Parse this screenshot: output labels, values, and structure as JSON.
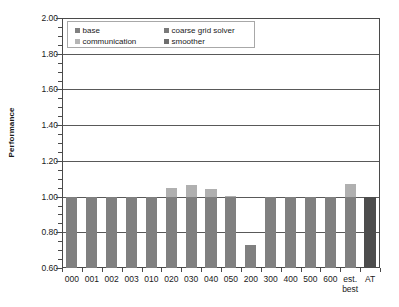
{
  "chart_data": {
    "type": "bar",
    "title": "",
    "subtitle": "",
    "xlabel": "",
    "ylabel": "Performance",
    "ylim": [
      0.6,
      2.0
    ],
    "ytick_labels": [
      "2.00",
      "1.80",
      "1.60",
      "1.40",
      "1.20",
      "1.00",
      "0.80",
      "0.60"
    ],
    "ytick_values": [
      2.0,
      1.8,
      1.6,
      1.4,
      1.2,
      1.0,
      0.8,
      0.6
    ],
    "ytick_step": 0.2,
    "yminor_step": 0.05,
    "grid": true,
    "grid_axis": "y",
    "legend_position": "top-left-inside",
    "stacked": true,
    "categories": [
      "000",
      "001",
      "002",
      "003",
      "010",
      "020",
      "030",
      "040",
      "050",
      "200",
      "300",
      "400",
      "500",
      "600",
      "est.\nbest",
      "AT"
    ],
    "category_labels_flat": [
      "000",
      "001",
      "002",
      "003",
      "010",
      "020",
      "030",
      "040",
      "050",
      "200",
      "300",
      "400",
      "500",
      "600",
      "est. best",
      "AT"
    ],
    "series": [
      {
        "name": "base",
        "color": "#808080",
        "values": [
          1.0,
          1.0,
          1.0,
          1.0,
          1.0,
          1.0,
          1.0,
          1.0,
          1.0,
          0.73,
          1.0,
          1.0,
          1.0,
          1.0,
          1.0,
          1.06
        ]
      },
      {
        "name": "coarse grid solver",
        "color": "#737373",
        "values": [
          0,
          0,
          0,
          0,
          0,
          0,
          0,
          0,
          0,
          0,
          0,
          0,
          0,
          0,
          0,
          0
        ]
      },
      {
        "name": "communication",
        "color": "#b3b3b3",
        "values": [
          0,
          0,
          0,
          0,
          0,
          0.05,
          0.065,
          0.045,
          0.005,
          0,
          0,
          0,
          0,
          0,
          0.07,
          0
        ]
      },
      {
        "name": "smoother",
        "color": "#6b6b6b",
        "values": [
          0,
          0,
          0,
          0,
          0,
          0,
          0,
          0,
          0,
          0,
          0,
          0,
          0,
          0,
          0,
          0
        ]
      }
    ],
    "totals": [
      1.0,
      1.0,
      1.0,
      1.0,
      1.0,
      1.05,
      1.065,
      1.045,
      1.005,
      0.73,
      1.0,
      1.0,
      1.0,
      1.0,
      1.07,
      1.06
    ],
    "bar_colors": [
      "#808080",
      "#808080",
      "#808080",
      "#808080",
      "#808080",
      "#808080",
      "#808080",
      "#808080",
      "#808080",
      "#808080",
      "#808080",
      "#808080",
      "#808080",
      "#808080",
      "#808080",
      "#4d4d4d"
    ],
    "top_colors": [
      null,
      null,
      null,
      null,
      null,
      "#b0b0b0",
      "#b0b0b0",
      "#b0b0b0",
      "#b0b0b0",
      null,
      null,
      null,
      null,
      null,
      "#b0b0b0",
      null
    ]
  },
  "legend": {
    "items": [
      {
        "label": "base",
        "color": "#808080"
      },
      {
        "label": "coarse grid solver",
        "color": "#7a7a7a"
      },
      {
        "label": "communication",
        "color": "#b5b5b5"
      },
      {
        "label": "smoother",
        "color": "#6e6e6e"
      }
    ]
  },
  "axis": {
    "y_title": "Performance"
  },
  "colors": {
    "axis_line": "#4a4a4a",
    "gridline": "#595959",
    "legend_border": "#a8a8a8",
    "background": "#ffffff",
    "text": "#1a1a1a"
  }
}
